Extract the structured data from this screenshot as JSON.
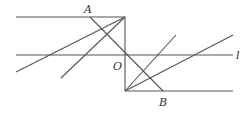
{
  "diagram": {
    "type": "geometry-figure",
    "labels": {
      "A": "A",
      "O": "O",
      "B": "B",
      "l": "l"
    },
    "colors": {
      "stroke": "#555555",
      "text": "#333333",
      "background": "#ffffff"
    }
  }
}
